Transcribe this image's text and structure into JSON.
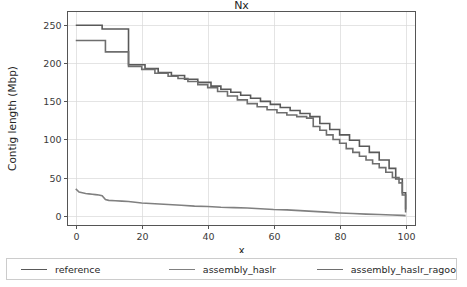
{
  "figure": {
    "background": "#ffffff",
    "width": 467,
    "height": 287
  },
  "chart_data": {
    "type": "line",
    "title": "Nx",
    "xlabel": "x",
    "ylabel": "Contig length (Mbp)",
    "xlim": [
      -2.5,
      103
    ],
    "ylim": [
      -13,
      268
    ],
    "xticks": [
      0,
      20,
      40,
      60,
      80,
      100
    ],
    "yticks": [
      0,
      50,
      100,
      150,
      200,
      250
    ],
    "xtick_labels": [
      "0",
      "20",
      "40",
      "60",
      "80",
      "100"
    ],
    "ytick_labels": [
      "0",
      "50",
      "100",
      "150",
      "200",
      "250"
    ],
    "grid": true,
    "drawstyle": "steps-post",
    "legend_position": "below-figure",
    "series": [
      {
        "name": "reference",
        "color": "#595959",
        "x": [
          0,
          8,
          16,
          21,
          25,
          29,
          33,
          37,
          41,
          44,
          47,
          50,
          53,
          56,
          59,
          62,
          65,
          68,
          71,
          74,
          77,
          80,
          83,
          86,
          89,
          92,
          95,
          97,
          99,
          100
        ],
        "y": [
          250,
          245,
          198,
          193,
          188,
          184,
          179,
          175,
          170,
          166,
          162,
          158,
          154,
          150,
          146,
          142,
          138,
          134,
          130,
          121,
          113,
          106,
          99,
          91,
          83,
          73,
          62,
          48,
          30,
          8
        ]
      },
      {
        "name": "assembly_haslr",
        "color": "#808080",
        "x": [
          0,
          1,
          2,
          3,
          4,
          5,
          6,
          7,
          8,
          9,
          10,
          12,
          14,
          16,
          18,
          20,
          24,
          28,
          32,
          36,
          40,
          44,
          48,
          52,
          56,
          60,
          64,
          68,
          72,
          76,
          80,
          84,
          88,
          92,
          96,
          99,
          100
        ],
        "y": [
          35,
          31,
          30,
          29,
          28.5,
          28,
          27.5,
          27,
          26,
          21,
          20,
          19.5,
          19,
          18.5,
          17.5,
          16.5,
          15.5,
          14.5,
          13.5,
          12.5,
          12,
          11,
          10.5,
          10,
          9,
          8,
          7.5,
          6.5,
          5.5,
          4.5,
          3.5,
          2.8,
          2,
          1.4,
          0.8,
          0.3,
          0
        ]
      },
      {
        "name": "assembly_haslr_ragoo",
        "color": "#6e6e6e",
        "x": [
          0,
          9,
          16,
          20,
          24,
          28,
          31,
          34,
          37,
          40,
          43,
          46,
          49,
          52,
          55,
          58,
          61,
          64,
          67,
          70,
          72,
          74,
          76,
          78,
          80,
          82,
          84,
          86,
          88,
          90,
          92,
          94,
          96,
          98,
          99,
          100
        ],
        "y": [
          230,
          215,
          196,
          192,
          187,
          183,
          180,
          176,
          172,
          168,
          163,
          157,
          152,
          147,
          143,
          139,
          135,
          132,
          130,
          128,
          117,
          112,
          106,
          100,
          95,
          88,
          83,
          78,
          73,
          68,
          63,
          57,
          50,
          43,
          27,
          4
        ]
      }
    ]
  },
  "legend": {
    "entries": [
      {
        "label": "reference",
        "color": "#595959"
      },
      {
        "label": "assembly_haslr",
        "color": "#808080"
      },
      {
        "label": "assembly_haslr_ragoo",
        "color": "#6e6e6e"
      }
    ]
  }
}
